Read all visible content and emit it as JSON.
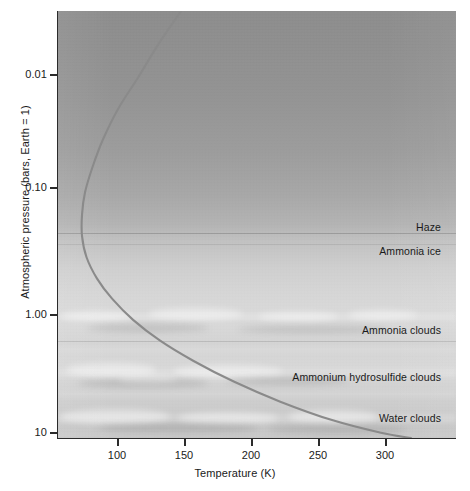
{
  "figure": {
    "background_color": "#ffffff",
    "plot_top_color": "#8d8d8d",
    "plot_bottom_color": "#c4c4c4",
    "curve_color": "#8a8a8a",
    "axis_color": "#2b2b2b"
  },
  "chart_data": {
    "type": "line",
    "title": "",
    "subtitle": "",
    "xlabel": "Temperature (K)",
    "ylabel": "Atmospheric pressure (bars, Earth = 1)",
    "xlim": [
      65,
      330
    ],
    "ylim": [
      0.0018,
      10
    ],
    "y_scale": "log",
    "y_inverted": true,
    "grid": false,
    "legend": null,
    "xticks": [
      100,
      150,
      200,
      250,
      300
    ],
    "xticklabels": [
      "100",
      "150",
      "200",
      "250",
      "300"
    ],
    "yticks": [
      0.01,
      0.1,
      1.0,
      10
    ],
    "yticklabels": [
      "0.01",
      "0.10",
      "1.00",
      "10"
    ],
    "series": [
      {
        "name": "Temperature profile",
        "color": "#8a8a8a",
        "points": [
          {
            "t": 147,
            "p": 0.0018
          },
          {
            "t": 132,
            "p": 0.0035
          },
          {
            "t": 118,
            "p": 0.007
          },
          {
            "t": 105,
            "p": 0.013
          },
          {
            "t": 95,
            "p": 0.024
          },
          {
            "t": 88,
            "p": 0.042
          },
          {
            "t": 83,
            "p": 0.07
          },
          {
            "t": 81,
            "p": 0.11
          },
          {
            "t": 81,
            "p": 0.17
          },
          {
            "t": 84,
            "p": 0.26
          },
          {
            "t": 91,
            "p": 0.4
          },
          {
            "t": 101,
            "p": 0.6
          },
          {
            "t": 115,
            "p": 0.92
          },
          {
            "t": 133,
            "p": 1.4
          },
          {
            "t": 155,
            "p": 2.1
          },
          {
            "t": 182,
            "p": 3.2
          },
          {
            "t": 213,
            "p": 4.8
          },
          {
            "t": 248,
            "p": 7.0
          },
          {
            "t": 280,
            "p": 9.0
          },
          {
            "t": 300,
            "p": 10.0
          }
        ]
      }
    ],
    "annotations": [
      {
        "label": "Haze",
        "pressure": 0.2,
        "note": "upper haze layer"
      },
      {
        "label": "Ammonia ice",
        "pressure": 0.3,
        "note": "ammonia ice layer"
      },
      {
        "label": "Ammonia clouds",
        "pressure": 1.13,
        "note": "ammonia cloud deck"
      },
      {
        "label": "Ammonium hydrosulfide clouds",
        "pressure": 2.55,
        "note": "NH4SH cloud deck"
      },
      {
        "label": "Water clouds",
        "pressure": 5.6,
        "note": "water cloud deck"
      }
    ]
  },
  "axes": {
    "y_title": "Atmospheric pressure (bars, Earth = 1)",
    "x_title": "Temperature (K)",
    "y_ticks": [
      {
        "label": "0.01",
        "y": 74
      },
      {
        "label": "0.10",
        "y": 187
      },
      {
        "label": "1.00",
        "y": 314
      },
      {
        "label": "10",
        "y": 432
      }
    ],
    "x_ticks": [
      {
        "label": "100",
        "x": 117
      },
      {
        "label": "150",
        "x": 184
      },
      {
        "label": "200",
        "x": 251
      },
      {
        "label": "250",
        "x": 318
      },
      {
        "label": "300",
        "x": 385
      }
    ]
  },
  "annotations": [
    {
      "label": "Haze",
      "right": 15,
      "top": 221
    },
    {
      "label": "Ammonia ice",
      "right": 15,
      "top": 245
    },
    {
      "label": "Ammonia clouds",
      "right": 15,
      "top": 324
    },
    {
      "label": "Ammonium hydrosulfide clouds",
      "right": 15,
      "top": 371
    },
    {
      "label": "Water clouds",
      "right": 15,
      "top": 412
    }
  ]
}
